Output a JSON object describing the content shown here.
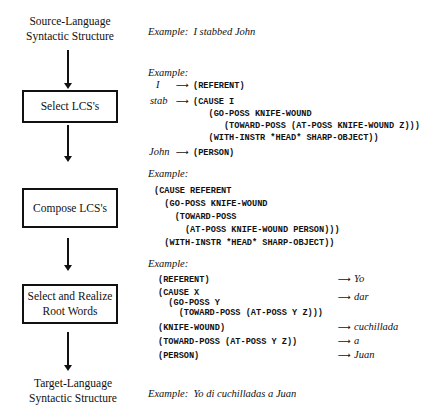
{
  "pipeline": {
    "source_label": [
      "Source-Language",
      "Syntactic Structure"
    ],
    "steps": [
      {
        "label": [
          "Select LCS's"
        ]
      },
      {
        "label": [
          "Compose LCS's"
        ]
      },
      {
        "label": [
          "Select and Realize",
          "Root Words"
        ]
      }
    ],
    "target_label": [
      "Target-Language",
      "Syntactic Structure"
    ]
  },
  "examples": {
    "source": {
      "prefix": "Example:",
      "text": "I stabbed John"
    },
    "select_lcs": {
      "prefix": "Example:",
      "arrow": "⟶",
      "mappings": [
        {
          "word": "I",
          "lcs": "(REFERENT)"
        },
        {
          "word": "stab",
          "lcs": "(CAUSE I\n   (GO-POSS KNIFE-WOUND\n      (TOWARD-POSS (AT-POSS KNIFE-WOUND Z)))\n   (WITH-INSTR *HEAD* SHARP-OBJECT))"
        },
        {
          "word": "John",
          "lcs": "(PERSON)"
        }
      ]
    },
    "compose_lcs": {
      "prefix": "Example:",
      "lcs": "(CAUSE REFERENT\n  (GO-POSS KNIFE-WOUND\n    (TOWARD-POSS\n      (AT-POSS KNIFE-WOUND PERSON)))\n  (WITH-INSTR *HEAD* SHARP-OBJECT))"
    },
    "realize": {
      "prefix": "Example:",
      "arrow": "⟶",
      "mappings": [
        {
          "lcs": "(REFERENT)",
          "word": "Yo"
        },
        {
          "lcs": "(CAUSE X\n  (GO-POSS Y\n    (TOWARD-POSS (AT-POSS Y Z)))",
          "word": "dar"
        },
        {
          "lcs": "(KNIFE-WOUND)",
          "word": "cuchillada"
        },
        {
          "lcs": "(TOWARD-POSS (AT-POSS Y Z))",
          "word": "a"
        },
        {
          "lcs": "(PERSON)",
          "word": "Juan"
        }
      ]
    },
    "target": {
      "prefix": "Example:",
      "text": "Yo di cuchilladas a Juan"
    }
  }
}
